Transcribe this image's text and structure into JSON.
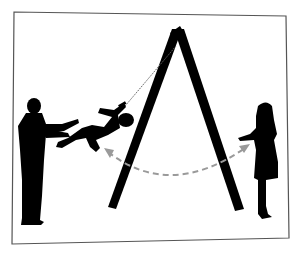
{
  "illustration": {
    "description": "Silhouette of a man pushing a child on an A-frame swing toward a girl standing on the right; dashed arrow shows the swing arc",
    "colors": {
      "background": "#ffffff",
      "frame_border": "#555555",
      "silhouette": "#000000",
      "arc_arrow": "#9a9a9a",
      "rope": "#666666"
    },
    "elements": [
      "picture-frame",
      "swing-frame",
      "man-silhouette",
      "child-on-swing",
      "girl-silhouette",
      "swing-arc-arrow"
    ]
  }
}
